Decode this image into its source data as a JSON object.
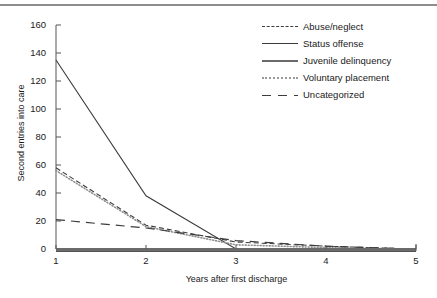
{
  "chart_data": {
    "type": "line",
    "title": "",
    "xlabel": "Years after first discharge",
    "ylabel": "Second entries into care",
    "x": [
      1,
      2,
      3,
      4,
      5
    ],
    "xlim": [
      1,
      5
    ],
    "ylim": [
      0,
      160
    ],
    "yticks": [
      0,
      20,
      40,
      60,
      80,
      100,
      120,
      140,
      160
    ],
    "xticks": [
      1,
      2,
      3,
      4,
      5
    ],
    "grid": false,
    "legend_position": "top-right",
    "series": [
      {
        "name": "Abuse/neglect",
        "style": "dashed",
        "color": "#3c3c3c",
        "values": [
          58,
          17,
          5,
          2,
          0
        ]
      },
      {
        "name": "Status offense",
        "style": "solid-thin",
        "color": "#3c3c3c",
        "values": [
          135,
          38,
          0,
          0,
          0
        ]
      },
      {
        "name": "Juvenile delinquency",
        "style": "solid-thick",
        "color": "#6b6b6b",
        "values": [
          0,
          0,
          0,
          0,
          0
        ]
      },
      {
        "name": "Voluntary placement",
        "style": "dotted",
        "color": "#9a9a9a",
        "values": [
          56,
          16,
          3,
          1,
          0
        ]
      },
      {
        "name": "Uncategorized",
        "style": "long-dash",
        "color": "#3c3c3c",
        "values": [
          21,
          15,
          6,
          2,
          0
        ]
      }
    ]
  },
  "axes": {
    "ylabel": "Second entries into care",
    "xlabel": "Years after first discharge",
    "ytick_labels": [
      "160",
      "140",
      "120",
      "100",
      "80",
      "60",
      "40",
      "20",
      "0"
    ],
    "xtick_labels": [
      "1",
      "2",
      "3",
      "4",
      "5"
    ]
  },
  "legend": {
    "items": [
      {
        "label": "Abuse/neglect"
      },
      {
        "label": "Status offense"
      },
      {
        "label": "Juvenile delinquency"
      },
      {
        "label": "Voluntary placement"
      },
      {
        "label": "Uncategorized"
      }
    ]
  }
}
